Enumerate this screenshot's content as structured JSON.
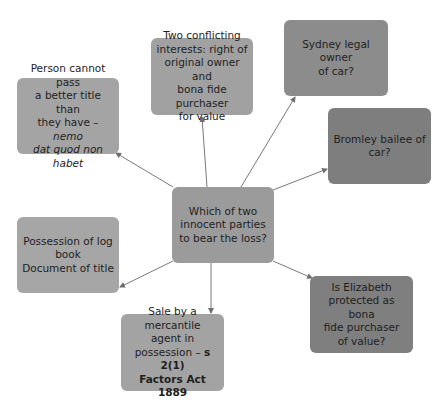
{
  "diagram": {
    "type": "mind-map",
    "center": {
      "id": "center",
      "lines": [
        "Which of two",
        "innocent parties",
        "to bear the loss?"
      ],
      "color": "#9b9b9b",
      "box": {
        "x": 172,
        "y": 187,
        "w": 102,
        "h": 76
      }
    },
    "nodes": [
      {
        "id": "nemo-dat",
        "lines": [
          "Person cannot pass",
          "a better title than",
          "they have – ",
          "dat quod non habet"
        ],
        "italic_fragment": "nemo",
        "plain_line3": "they have – ",
        "italic_line4": "dat quod non habet",
        "color": "#a4a4a4",
        "box": {
          "x": 17,
          "y": 78,
          "w": 102,
          "h": 76
        }
      },
      {
        "id": "conflicting-interests",
        "lines": [
          "Two conflicting",
          "interests: right of",
          "original owner and",
          "bona fide purchaser",
          "for value"
        ],
        "color": "#a1a1a1",
        "box": {
          "x": 151,
          "y": 38,
          "w": 102,
          "h": 77
        }
      },
      {
        "id": "sydney-owner",
        "lines": [
          "Sydney legal owner",
          "of car?"
        ],
        "color": "#8c8c8c",
        "box": {
          "x": 284,
          "y": 20,
          "w": 104,
          "h": 76
        }
      },
      {
        "id": "bromley-bailee",
        "lines": [
          "Bromley bailee of",
          "car?"
        ],
        "color": "#7e7e7e",
        "box": {
          "x": 328,
          "y": 108,
          "w": 103,
          "h": 76
        }
      },
      {
        "id": "log-book",
        "lines": [
          "Possession of log",
          "book",
          "Document of title"
        ],
        "color": "#a6a6a6",
        "box": {
          "x": 17,
          "y": 217,
          "w": 102,
          "h": 76
        }
      },
      {
        "id": "mercantile-agent",
        "lines": [
          "Sale by a mercantile",
          "agent in",
          "possession – ",
          "Factors Act 1889"
        ],
        "bold_fragment": "s 2(1)",
        "color": "#a3a3a3",
        "box": {
          "x": 121,
          "y": 314,
          "w": 103,
          "h": 77
        }
      },
      {
        "id": "elizabeth-bfp",
        "lines": [
          "Is Elizabeth",
          "protected as bona",
          "fide purchaser",
          "of value?"
        ],
        "color": "#7f7f7f",
        "box": {
          "x": 310,
          "y": 276,
          "w": 103,
          "h": 77
        }
      }
    ],
    "edges": [
      {
        "from": "center",
        "to": "nemo-dat",
        "x1": 173,
        "y1": 187,
        "x2": 116,
        "y2": 153
      },
      {
        "from": "center",
        "to": "conflicting-interests",
        "x1": 207,
        "y1": 187,
        "x2": 202,
        "y2": 117
      },
      {
        "from": "center",
        "to": "sydney-owner",
        "x1": 241,
        "y1": 187,
        "x2": 295,
        "y2": 97
      },
      {
        "from": "center",
        "to": "bromley-bailee",
        "x1": 273,
        "y1": 190,
        "x2": 327,
        "y2": 169
      },
      {
        "from": "center",
        "to": "log-book",
        "x1": 173,
        "y1": 261,
        "x2": 120,
        "y2": 287
      },
      {
        "from": "center",
        "to": "mercantile-agent",
        "x1": 211,
        "y1": 263,
        "x2": 211,
        "y2": 313
      },
      {
        "from": "center",
        "to": "elizabeth-bfp",
        "x1": 273,
        "y1": 261,
        "x2": 312,
        "y2": 278
      }
    ],
    "edge_color": "#7a7a7a"
  }
}
